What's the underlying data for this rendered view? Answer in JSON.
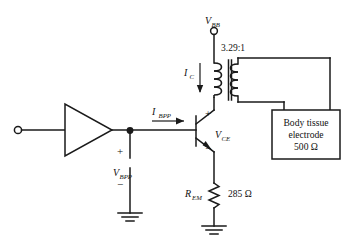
{
  "diagram": {
    "type": "electronic-schematic",
    "background_color": "#ffffff",
    "line_color": "#1a1a1a"
  },
  "labels": {
    "supply": "V",
    "supply_sub": "BB",
    "turns_ratio": "3.29:1",
    "collector_current": "I",
    "collector_current_sub": "C",
    "base_current": "I",
    "base_current_sub": "BPP",
    "vce": "V",
    "vce_sub": "CE",
    "vbpp": "V",
    "vbpp_sub": "BPP",
    "rem": "R",
    "rem_sub": "EM",
    "rem_value": "285 Ω",
    "plus": "+",
    "minus": "−"
  },
  "load_box": {
    "line1": "Body tissue",
    "line2": "electrode",
    "line3": "500 Ω"
  },
  "components": [
    {
      "name": "input-terminal",
      "kind": "terminal"
    },
    {
      "name": "amplifier-triangle",
      "kind": "amplifier"
    },
    {
      "name": "npn-transistor",
      "kind": "transistor"
    },
    {
      "name": "transformer",
      "kind": "transformer",
      "ratio": "3.29:1"
    },
    {
      "name": "emitter-resistor",
      "kind": "resistor",
      "value": "285 Ω"
    },
    {
      "name": "load-resistor-box",
      "kind": "load",
      "value": "500 Ω"
    },
    {
      "name": "source-vbpp",
      "kind": "voltage-source"
    },
    {
      "name": "ground-left",
      "kind": "ground"
    },
    {
      "name": "ground-right",
      "kind": "ground"
    }
  ]
}
